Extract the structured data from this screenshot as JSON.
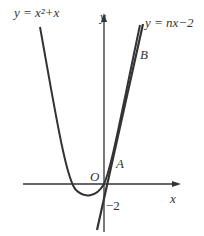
{
  "figure": {
    "curve_label": "y = x²+x",
    "line_label": "y = nx−2",
    "point_a": "A",
    "point_b": "B",
    "origin": "O",
    "x_axis": "x",
    "y_axis": "y",
    "intercept": "−2",
    "colors": {
      "ink": "#333333",
      "background": "#ffffff"
    }
  }
}
